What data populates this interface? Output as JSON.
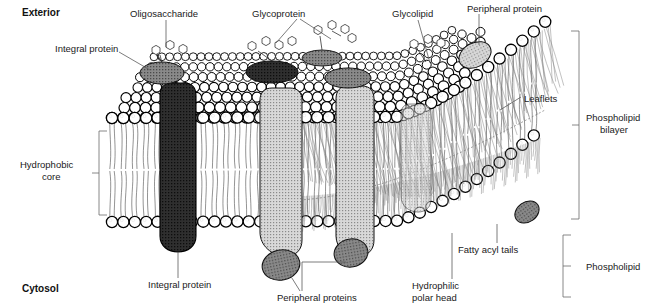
{
  "figure": {
    "width": 648,
    "height": 306,
    "background": "#ffffff"
  },
  "region_labels": {
    "exterior": "Exterior",
    "cytosol": "Cytosol"
  },
  "callouts": [
    {
      "id": "integral-protein-top",
      "text": "Integral protein",
      "x": 55,
      "y": 48
    },
    {
      "id": "oligosaccharide",
      "text": "Oligosaccharide",
      "x": 130,
      "y": 14
    },
    {
      "id": "glycoprotein",
      "text": "Glycoprotein",
      "x": 252,
      "y": 14
    },
    {
      "id": "glycolipid",
      "text": "Glycolipid",
      "x": 392,
      "y": 14
    },
    {
      "id": "peripheral-protein-top",
      "text": "Peripheral protein",
      "x": 467,
      "y": 9
    },
    {
      "id": "leaflets",
      "text": "Leaflets",
      "x": 524,
      "y": 99
    },
    {
      "id": "hydrophobic-core",
      "text": "Hydrophobic",
      "x": 52,
      "y": 165
    },
    {
      "id": "hydrophobic-core-2",
      "text": "core",
      "x": 52,
      "y": 177
    },
    {
      "id": "integral-protein-bottom",
      "text": "Integral protein",
      "x": 188,
      "y": 285
    },
    {
      "id": "peripheral-proteins",
      "text": "Peripheral proteins",
      "x": 303,
      "y": 297
    },
    {
      "id": "hydrophilic-head",
      "text": "Hydrophilic",
      "x": 437,
      "y": 286
    },
    {
      "id": "hydrophilic-head-2",
      "text": "polar head",
      "x": 437,
      "y": 298
    },
    {
      "id": "fatty-acyl-tails",
      "text": "Fatty acyl tails",
      "x": 462,
      "y": 250
    }
  ],
  "brackets": [
    {
      "id": "phospholipid-bilayer",
      "line1": "Phospholipid",
      "line2": "bilayer",
      "x": 586,
      "y": 117
    },
    {
      "id": "phospholipid",
      "line1": "Phospholipid",
      "line2": "",
      "x": 586,
      "y": 272
    }
  ],
  "colors": {
    "head_fill": "#ffffff",
    "head_stroke": "#000000",
    "integral_dark": "#2b2b2b",
    "integral_light": "#c9c9c9",
    "peripheral": "#8f8f8f",
    "leader": "#5a5a5a",
    "text": "#1a1a1a"
  },
  "structures": {
    "integral_proteins": 4,
    "peripheral_proteins": 4,
    "glycoprotein_chains": 2,
    "oligosaccharide_chains": 1,
    "glycolipid_chains": 1
  }
}
